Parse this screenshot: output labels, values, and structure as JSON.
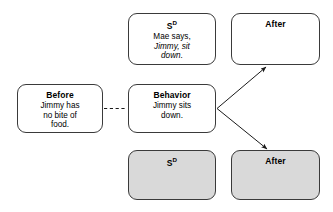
{
  "diagram": {
    "type": "behavior-contingency-diagram",
    "background_color": "#ffffff",
    "border_color": "#3a3a3a",
    "shaded_fill_color": "#d9d9d9",
    "boxes": {
      "sd_top": {
        "title": "S",
        "title_superscript": "D",
        "line1": "Mae says,",
        "line2": "Jimmy, sit",
        "line3": "down.",
        "fill": "white"
      },
      "after_top": {
        "title": "After",
        "body": "",
        "fill": "white"
      },
      "before": {
        "title": "Before",
        "line1": "Jimmy has",
        "line2": "no bite of",
        "line3": "food.",
        "fill": "white"
      },
      "behavior": {
        "title": "Behavior",
        "line1": "Jimmy sits",
        "line2": "down.",
        "fill": "white"
      },
      "sd_bottom": {
        "title": "S",
        "title_superscript": "D",
        "body": "",
        "fill": "shaded"
      },
      "after_bottom": {
        "title": "After",
        "body": "",
        "fill": "shaded"
      }
    },
    "connectors": [
      {
        "name": "before-to-behavior",
        "style": "dashed",
        "from": "before",
        "to": "behavior",
        "arrowhead": false
      },
      {
        "name": "behavior-to-after-top",
        "style": "solid",
        "from": "behavior",
        "to": "after_top",
        "arrowhead": true
      },
      {
        "name": "behavior-to-after-bottom",
        "style": "solid",
        "from": "behavior",
        "to": "after_bottom",
        "arrowhead": true
      }
    ]
  }
}
